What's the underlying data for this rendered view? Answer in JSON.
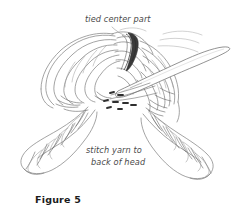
{
  "figure": {
    "caption": "Figure 5",
    "background_color": "#ffffff",
    "ink_color": "#6b6b6b",
    "text_color": "#4a4a4a"
  },
  "annotations": {
    "top_label": "tied center part",
    "bottom_label_line1": "stitch yarn to",
    "bottom_label_line2": "back of head"
  },
  "illustration": {
    "subject": "doll wig with tied center part and two coiled braids",
    "needle_label": "sewing-needle",
    "knot_label": "tied-center-knot",
    "stitch_label": "stitch-marks",
    "left_braid_label": "left-coiled-braid",
    "right_braid_label": "right-coiled-braid"
  }
}
